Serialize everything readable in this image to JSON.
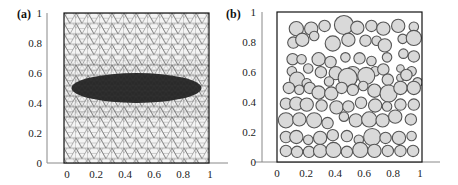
{
  "figure": {
    "panels": [
      {
        "label": "(a)",
        "description": "Triangular finite element mesh of unit square with elliptical dark inclusion"
      },
      {
        "label": "(b)",
        "description": "Unit square with randomly distributed circular particles"
      }
    ]
  },
  "chart_data": [
    {
      "type": "scatter",
      "panel": "(a)",
      "title": "",
      "xlabel": "",
      "ylabel": "",
      "xlim": [
        0,
        1
      ],
      "ylim": [
        0,
        1
      ],
      "x_ticks": [
        "0",
        "0.2",
        "0.4",
        "0.6",
        "0.8",
        "1"
      ],
      "y_ticks": [
        "0",
        "0.2",
        "0.4",
        "0.6",
        "0.8",
        "1"
      ],
      "grid": false,
      "content": "triangular mesh",
      "inclusion": {
        "shape": "ellipse",
        "center": [
          0.5,
          0.5
        ],
        "semi_axis_x": 0.45,
        "semi_axis_y": 0.1,
        "fill": "#2a2a2a"
      },
      "mesh_color": "#555555"
    },
    {
      "type": "scatter",
      "panel": "(b)",
      "title": "",
      "xlabel": "",
      "ylabel": "",
      "xlim": [
        0,
        1
      ],
      "ylim": [
        0,
        1
      ],
      "x_ticks": [
        "0",
        "0.2",
        "0.4",
        "0.6",
        "0.8",
        "1"
      ],
      "y_ticks": [
        "0",
        "0.2",
        "0.4",
        "0.6",
        "0.8",
        "1"
      ],
      "grid": false,
      "content": "circular particles",
      "particle_fill": "#d9d9d9",
      "particle_stroke": "#555555",
      "particles_px": [
        [
          26,
          18,
          7.5
        ],
        [
          46,
          18,
          7
        ],
        [
          64,
          15,
          6
        ],
        [
          90,
          14,
          10
        ],
        [
          108,
          17,
          7
        ],
        [
          127,
          15,
          6
        ],
        [
          143,
          18,
          7
        ],
        [
          163,
          15,
          7
        ],
        [
          184,
          16,
          5
        ],
        [
          22,
          33,
          6
        ],
        [
          34,
          30,
          7
        ],
        [
          50,
          26,
          5
        ],
        [
          75,
          34,
          8
        ],
        [
          96,
          30,
          7
        ],
        [
          119,
          31,
          6
        ],
        [
          134,
          31,
          5
        ],
        [
          145,
          36,
          7
        ],
        [
          169,
          29,
          5
        ],
        [
          184,
          28,
          8
        ],
        [
          21,
          51,
          6
        ],
        [
          33,
          51,
          5
        ],
        [
          56,
          51,
          7
        ],
        [
          72,
          54,
          6
        ],
        [
          92,
          49,
          5
        ],
        [
          111,
          50,
          6
        ],
        [
          127,
          53,
          5
        ],
        [
          148,
          49,
          5
        ],
        [
          170,
          45,
          5
        ],
        [
          184,
          48,
          6
        ],
        [
          20,
          64,
          5
        ],
        [
          42,
          61,
          5
        ],
        [
          59,
          65,
          6
        ],
        [
          79,
          66,
          7
        ],
        [
          102,
          67,
          8
        ],
        [
          132,
          64,
          5
        ],
        [
          143,
          62,
          6
        ],
        [
          166,
          61,
          4
        ],
        [
          181,
          64,
          5
        ],
        [
          166,
          71,
          4
        ],
        [
          27,
          73,
          8
        ],
        [
          40,
          77,
          5
        ],
        [
          70,
          75,
          5
        ],
        [
          95,
          71,
          10
        ],
        [
          120,
          69,
          9
        ],
        [
          149,
          73,
          6
        ],
        [
          174,
          68,
          6
        ],
        [
          189,
          76,
          5
        ]
      ],
      "note": "particles approximated; see particles_rows for full layout"
    }
  ]
}
